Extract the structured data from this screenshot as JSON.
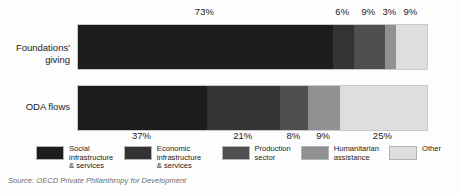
{
  "chart_data": {
    "type": "bar",
    "orientation": "horizontal",
    "stacked": true,
    "normalized_percent": true,
    "title": "",
    "subtitle": "",
    "xlabel": "",
    "ylabel": "",
    "xlim": [
      0,
      100
    ],
    "grid": false,
    "legend_position": "bottom",
    "categories": [
      "Foundations' giving",
      "ODA flows"
    ],
    "series": [
      {
        "name": "Social infrastructure & services",
        "color": "#1d1d1d",
        "values": [
          73,
          37
        ],
        "labels": [
          "73%",
          "37%"
        ]
      },
      {
        "name": "Economic infrastructure & services",
        "color": "#333333",
        "values": [
          6,
          21
        ],
        "labels": [
          "6%",
          "21%"
        ]
      },
      {
        "name": "Production sector",
        "color": "#4f4f4f",
        "values": [
          9,
          8
        ],
        "labels": [
          "9%",
          "8%"
        ]
      },
      {
        "name": "Humanitarian assistance",
        "color": "#919191",
        "values": [
          3,
          9
        ],
        "labels": [
          "3%",
          "9%"
        ]
      },
      {
        "name": "Other",
        "color": "#dedede",
        "values": [
          9,
          25
        ],
        "labels": [
          "9%",
          "25%"
        ]
      }
    ],
    "annotations": {
      "source": "Source: OECD Private Philanthropy for Development"
    }
  },
  "axis": {
    "row_labels": [
      {
        "line1": "Foundations'",
        "line2": "giving"
      },
      {
        "line1": "ODA flows",
        "line2": ""
      }
    ]
  },
  "value_labels": {
    "foundations": [
      "73%",
      "6%",
      "9%",
      "3%",
      "9%"
    ],
    "oda": [
      "37%",
      "21%",
      "8%",
      "9%",
      "25%"
    ]
  },
  "legend": {
    "items": [
      {
        "label": "Social infrastructure\n& services",
        "color": "#1d1d1d"
      },
      {
        "label": "Economic infrastructure\n& services",
        "color": "#333333"
      },
      {
        "label": "Production\nsector",
        "color": "#4f4f4f"
      },
      {
        "label": "Humanitarian\nassistance",
        "color": "#919191"
      },
      {
        "label": "Other",
        "color": "#dedede"
      }
    ]
  },
  "source": {
    "text": "Source: OECD Private Philanthropy for Development"
  }
}
